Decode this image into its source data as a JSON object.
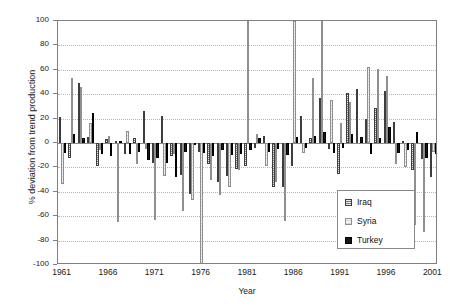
{
  "chart_data": {
    "type": "bar",
    "title": "",
    "xlabel": "Year",
    "ylabel": "% deviation from trend production",
    "ylim": [
      -100,
      100
    ],
    "xlim": [
      1961,
      2001
    ],
    "grid": true,
    "legend_position": "lower-right",
    "ytick_labels": [
      "100",
      "80",
      "60",
      "40",
      "20",
      "0",
      "-20",
      "-40",
      "-60",
      "-80",
      "-100"
    ],
    "ytick_values": [
      100,
      80,
      60,
      40,
      20,
      0,
      -20,
      -40,
      -60,
      -80,
      -100
    ],
    "xtick_labels": [
      "1961",
      "1966",
      "1971",
      "1976",
      "1981",
      "1986",
      "1991",
      "1996",
      "2001"
    ],
    "xtick_values": [
      1961,
      1966,
      1971,
      1976,
      1981,
      1986,
      1991,
      1996,
      2001
    ],
    "categories": [
      1961,
      1962,
      1963,
      1964,
      1965,
      1966,
      1967,
      1968,
      1969,
      1970,
      1971,
      1972,
      1973,
      1974,
      1975,
      1976,
      1977,
      1978,
      1979,
      1980,
      1981,
      1982,
      1983,
      1984,
      1985,
      1986,
      1987,
      1988,
      1989,
      1990,
      1991,
      1992,
      1993,
      1994,
      1995,
      1996,
      1997,
      1998,
      1999,
      2000,
      2001
    ],
    "series": [
      {
        "name": "Iraq",
        "color": "#7a7a7a",
        "pattern": "horizontal-hatch",
        "values": [
          21,
          -12,
          49,
          5,
          -19,
          3,
          2,
          -9,
          4,
          26,
          -16,
          22,
          -11,
          -26,
          -42,
          -7,
          -17,
          -32,
          -27,
          -21,
          -19,
          -4,
          6,
          -36,
          -36,
          -19,
          22,
          4,
          37,
          -5,
          -25,
          41,
          44,
          20,
          29,
          43,
          17,
          2,
          -22,
          -13,
          -28
        ]
      },
      {
        "name": "Syria",
        "color": "#f2f2f2",
        "pattern": "light-hatch",
        "values": [
          -34,
          53,
          46,
          16,
          -6,
          6,
          -65,
          10,
          -17,
          -5,
          -63,
          -27,
          -9,
          -56,
          -47,
          -99,
          -30,
          -43,
          -36,
          -22,
          100,
          7,
          -19,
          -32,
          -64,
          100,
          -8,
          53,
          100,
          35,
          16,
          34,
          0,
          62,
          61,
          55,
          -17,
          -20,
          -67,
          -73,
          -7
        ]
      },
      {
        "name": "Turkey",
        "color": "#161616",
        "pattern": "solid",
        "values": [
          -8,
          7,
          4,
          25,
          -9,
          -11,
          2,
          -9,
          -7,
          -14,
          -12,
          -16,
          -28,
          -7,
          -2,
          -8,
          -11,
          -6,
          -10,
          -9,
          -6,
          4,
          -7,
          -5,
          -10,
          5,
          -4,
          6,
          9,
          -8,
          -4,
          7,
          5,
          -9,
          4,
          13,
          -8,
          -6,
          9,
          -12,
          -9
        ]
      }
    ]
  },
  "legend": {
    "items": [
      {
        "label": "Iraq"
      },
      {
        "label": "Syria"
      },
      {
        "label": "Turkey"
      }
    ]
  }
}
